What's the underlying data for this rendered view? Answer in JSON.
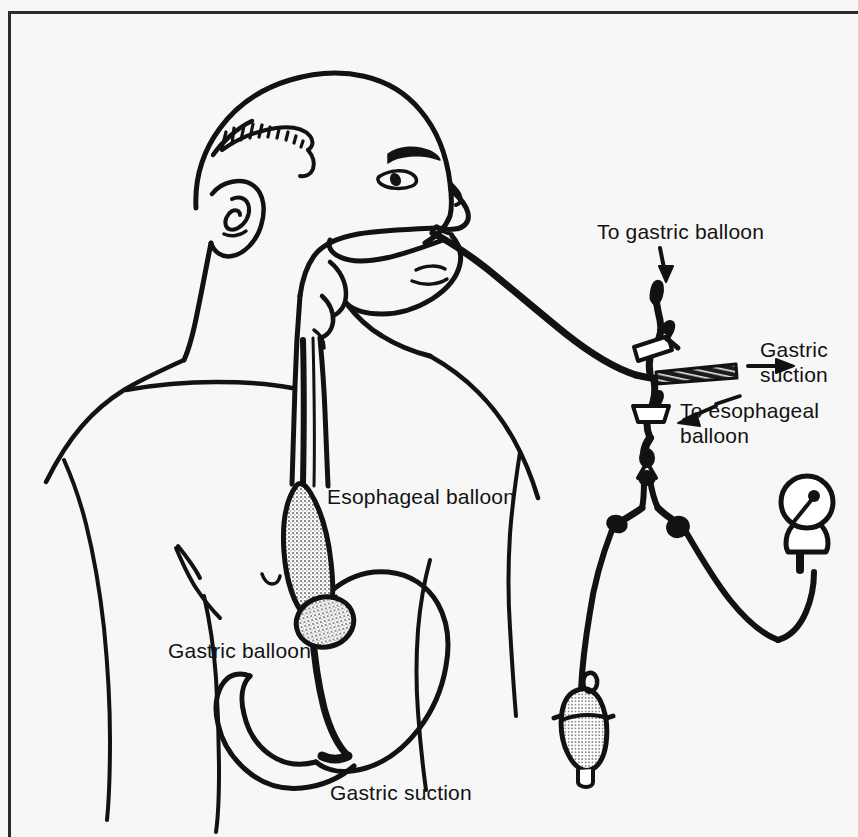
{
  "figure": {
    "background_color": "#f8f7f7",
    "ink_color": "#121212",
    "frame_color": "#2b2b2b",
    "stipple_color": "#8a8a8a"
  },
  "labels": {
    "to_gastric_balloon": "To gastric balloon",
    "gastric_suction_right": "Gastric\nsuction",
    "to_esophageal_balloon": "To esophageal\nballoon",
    "esophageal_balloon": "Esophageal balloon",
    "gastric_balloon": "Gastric balloon",
    "gastric_suction_bottom": "Gastric suction"
  },
  "diagram_parts": [
    {
      "name": "patient-head-profile",
      "description": "line-art bald male head in right profile"
    },
    {
      "name": "patient-torso",
      "description": "shoulder, chest and arm outline"
    },
    {
      "name": "nasal-tube-insertion",
      "description": "tube entering through the nostril"
    },
    {
      "name": "pharynx-esophagus",
      "description": "airway and esophagus outline through the neck"
    },
    {
      "name": "esophageal-balloon",
      "description": "elongated stippled balloon in the esophagus"
    },
    {
      "name": "gastric-balloon",
      "description": "round stippled balloon at the cardia"
    },
    {
      "name": "stomach-outline",
      "description": "stomach with greater curvature and pylorus"
    },
    {
      "name": "gastric-suction-tube-tip",
      "description": "tube tip in the gastric antrum"
    },
    {
      "name": "triple-lumen-junction",
      "description": "three-way junction of the tube outside the nose"
    },
    {
      "name": "gastric-balloon-clamp",
      "description": "clamp on gastric balloon inflation port"
    },
    {
      "name": "esophageal-balloon-clamp",
      "description": "clamp on esophageal balloon inflation port"
    },
    {
      "name": "gastric-suction-port",
      "description": "shaded suction lumen going to the right"
    },
    {
      "name": "y-connector",
      "description": "Y connector splitting to bulb and manometer"
    },
    {
      "name": "pressure-gauge",
      "description": "round manometer dial with needle"
    },
    {
      "name": "inflation-bulb",
      "description": "stippled squeeze bulb for inflation"
    }
  ],
  "arrows": [
    {
      "name": "arrow-to-gastric-balloon",
      "direction": "down-left",
      "points_to": "gastric balloon inflation port"
    },
    {
      "name": "arrow-gastric-suction",
      "direction": "right",
      "points_to": "gastric suction lumen"
    },
    {
      "name": "arrow-to-esophageal-balloon",
      "direction": "left",
      "points_to": "esophageal balloon inflation port"
    }
  ]
}
